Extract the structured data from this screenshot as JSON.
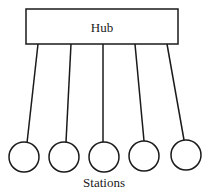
{
  "diagram": {
    "hub": {
      "label": "Hub",
      "x": 26,
      "y": 9,
      "w": 152,
      "h": 35
    },
    "links": [
      {
        "x1": 38,
        "y1": 44,
        "x2": 27,
        "y2": 143
      },
      {
        "x1": 71,
        "y1": 44,
        "x2": 66,
        "y2": 142
      },
      {
        "x1": 103,
        "y1": 44,
        "x2": 103,
        "y2": 142
      },
      {
        "x1": 135,
        "y1": 44,
        "x2": 144,
        "y2": 141
      },
      {
        "x1": 167,
        "y1": 44,
        "x2": 184,
        "y2": 140
      }
    ],
    "stations": [
      {
        "cx": 24,
        "cy": 157
      },
      {
        "cx": 64,
        "cy": 157
      },
      {
        "cx": 104,
        "cy": 157
      },
      {
        "cx": 144,
        "cy": 156
      },
      {
        "cx": 186,
        "cy": 155
      }
    ],
    "station_radius": 15,
    "stations_label": "Stations",
    "stroke_color": "#1a1a1a"
  }
}
